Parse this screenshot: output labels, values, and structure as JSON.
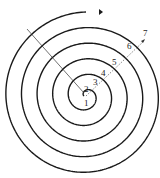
{
  "diagram": {
    "type": "spiral",
    "turn_labels": [
      "1",
      "2",
      "3",
      "4",
      "5",
      "6",
      "7"
    ],
    "colors": {
      "stroke": "#1a1a1a",
      "background": "#ffffff"
    }
  }
}
